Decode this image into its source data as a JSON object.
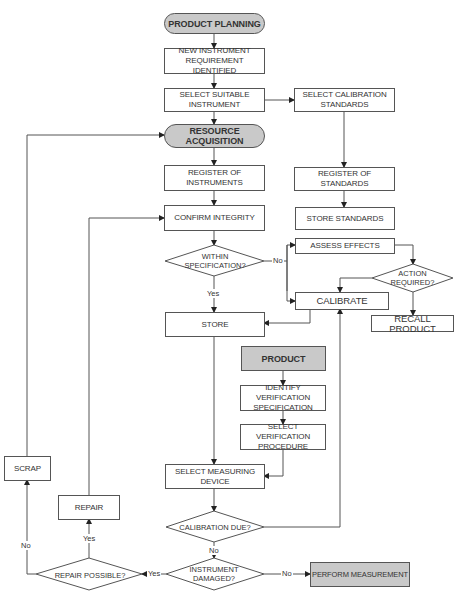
{
  "nodes": {
    "product_planning": "PRODUCT PLANNING",
    "new_instrument": "NEW INSTRUMENT REQUIREMENT IDENTIFIED",
    "select_suitable_instrument": "SELECT SUITABLE INSTRUMENT",
    "select_calibration_standards": "SELECT CALIBRATION STANDARDS",
    "resource_acquisition": "RESOURCE ACQUISITION",
    "register_of_instruments": "REGISTER OF INSTRUMENTS",
    "register_of_standards": "REGISTER OF STANDARDS",
    "confirm_integrity": "CONFIRM INTEGRITY",
    "store_standards": "STORE STANDARDS",
    "within_specification": "WITHIN SPECIFICATION?",
    "assess_effects": "ASSESS EFFECTS",
    "action_required": "ACTION REQUIRED?",
    "calibrate": "CALIBRATE",
    "recall_product": "RECALL PRODUCT",
    "store": "STORE",
    "product": "PRODUCT",
    "identify_verification_specification": "IDENTIFY VERIFICATION SPECIFICATION",
    "select_verification_procedure": "SELECT VERIFICATION PROCEDURE",
    "select_measuring_device": "SELECT MEASURING DEVICE",
    "calibration_due": "CALIBRATION DUE?",
    "instrument_damaged": "INSTRUMENT DAMAGED?",
    "repair_possible": "REPAIR POSSIBLE?",
    "repair": "REPAIR",
    "scrap": "SCRAP",
    "perform_measurement": "PERFORM MEASUREMENT"
  },
  "edge_labels": {
    "within_spec_no": "No",
    "within_spec_yes": "Yes",
    "calibration_due_no": "No",
    "damaged_no": "No",
    "damaged_yes": "Yes",
    "repair_possible_yes": "Yes",
    "repair_possible_no": "No"
  },
  "colors": {
    "terminal_fill": "#c9c9c9",
    "process_fill": "#ffffff",
    "stroke": "#555555",
    "text": "#333333"
  }
}
